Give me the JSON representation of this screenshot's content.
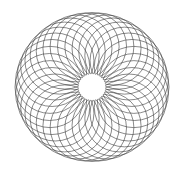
{
  "figure": {
    "type": "spirograph-rosette",
    "background_color": "#ffffff",
    "stroke_color": "#3a3a3a",
    "stroke_width": 0.6,
    "canvas": {
      "width": 183,
      "height": 175
    }
  },
  "geometry": {
    "center": {
      "x": 92,
      "y": 87
    },
    "circle_count": 36,
    "generating_circle_radius_x": 34.5,
    "generating_circle_radius_y": 33.5,
    "center_path_radius_x": 42.5,
    "center_path_radius_y": 41.0,
    "start_angle_deg": 0,
    "angle_step_deg": 10,
    "outer_envelope": {
      "radius_x": 77,
      "radius_y": 74.5,
      "left": 15,
      "right": 169,
      "top": 12.5,
      "bottom": 161.5
    },
    "inner_void": {
      "radius_x": 8.0,
      "radius_y": 7.5,
      "visible_radius": 14,
      "fill": "#ffffff"
    }
  },
  "chart_data": {
    "type": "scatter",
    "xlabel": "",
    "ylabel": "",
    "grid": false,
    "legend": null,
    "xlim": [
      0,
      183
    ],
    "ylim": [
      0,
      175
    ],
    "series": [
      {
        "name": "generating-circle-centers",
        "note": "Centers of the 36 identical circles, evenly spaced every 10 degrees on an ellipse of semi-axes 42.5 x 41.0 about (92, 87).",
        "x": [
          134.5,
          133.9,
          132.1,
          129.3,
          125.6,
          120.8,
          115.3,
          109.0,
          102.1,
          94.8,
          87.2,
          79.5,
          71.9,
          64.6,
          57.7,
          51.4,
          45.9,
          41.1,
          37.4,
          34.6,
          32.8,
          32.2,
          32.8,
          34.6,
          37.4,
          41.1,
          45.9,
          51.4,
          57.7,
          64.6,
          71.9,
          79.5,
          87.2,
          94.8,
          102.1,
          109.0,
          115.3,
          120.8,
          125.6,
          129.3,
          132.1,
          133.9
        ],
        "y": [
          87.0,
          94.1,
          101.0,
          107.5,
          113.4,
          118.5,
          122.7,
          125.8,
          127.8,
          128.6,
          128.1,
          126.4,
          123.5,
          119.5,
          114.5,
          108.6,
          102.0,
          94.8,
          87.3,
          79.6,
          72.0,
          64.5,
          57.3,
          50.6,
          44.4,
          38.9,
          34.2,
          30.3,
          27.3,
          25.2,
          24.1,
          24.1,
          25.1,
          27.1,
          30.1,
          34.0,
          38.8,
          44.3,
          50.5,
          57.2,
          64.4,
          71.9
        ]
      }
    ]
  }
}
